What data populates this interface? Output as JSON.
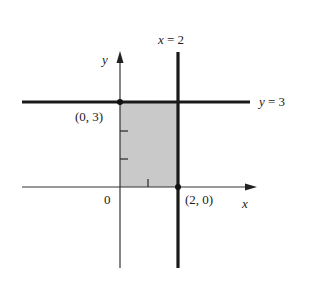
{
  "diagram": {
    "type": "coordinate-plane-region",
    "colors": {
      "line": "#1a1a1a",
      "axis": "#333333",
      "shade": "#c9c9c9",
      "background": "#ffffff"
    },
    "axes": {
      "x_label": "x",
      "y_label": "y",
      "origin_label": "0"
    },
    "lines": [
      {
        "equation_lhs": "y",
        "equation_rhs": "3",
        "label": "y = 3"
      },
      {
        "equation_lhs": "x",
        "equation_rhs": "2",
        "label": "x = 2"
      }
    ],
    "points": [
      {
        "label": "(0, 3)"
      },
      {
        "label": "(2, 0)"
      }
    ],
    "shaded_region": "0 ≤ x ≤ 2, 0 ≤ y ≤ 3"
  },
  "text": {
    "line_y3_lhs": "y",
    "line_y3_rhs": " = 3",
    "line_x2_lhs": "x",
    "line_x2_rhs": " = 2",
    "point_a": "(0, 3)",
    "point_b": "(2, 0)",
    "x_axis": "x",
    "y_axis": "y",
    "origin": "0"
  }
}
